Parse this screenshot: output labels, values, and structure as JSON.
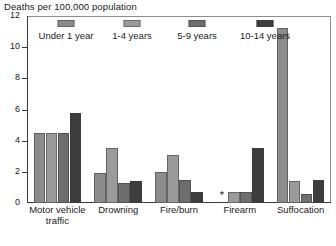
{
  "chart_data": {
    "type": "bar",
    "title": "Deaths per 100,000 population",
    "xlabel": "",
    "ylabel": "Deaths per 100,000 population",
    "ylim": [
      0,
      12
    ],
    "yticks": [
      0,
      2,
      4,
      6,
      8,
      10,
      12
    ],
    "grid": false,
    "legend_position": "top",
    "categories": [
      "Motor vehicle traffic",
      "Drowning",
      "Fire/burn",
      "Firearm",
      "Suffocation"
    ],
    "series": [
      {
        "name": "Under 1 year",
        "color": "#8c8c8c",
        "values": [
          4.5,
          1.9,
          2.0,
          null,
          11.2
        ],
        "value_labels": [
          "4.5",
          "1.9",
          "2.0",
          "*",
          "11.2"
        ]
      },
      {
        "name": "1-4 years",
        "color": "#9a9a9a",
        "values": [
          4.5,
          3.5,
          3.1,
          0.7,
          1.4
        ],
        "value_labels": [
          "4.5",
          "3.5",
          "3.1",
          "0.7",
          "1.4"
        ]
      },
      {
        "name": "5-9 years",
        "color": "#6e6e6e",
        "values": [
          4.5,
          1.3,
          1.5,
          0.7,
          0.6
        ],
        "value_labels": [
          "4.5",
          "1.3",
          "1.5",
          "0.7",
          "0.6"
        ]
      },
      {
        "name": "10-14 years",
        "color": "#3d3d3d",
        "values": [
          5.8,
          1.4,
          0.7,
          3.5,
          1.5
        ],
        "value_labels": [
          "5.8",
          "1.4",
          "0.7",
          "3.5",
          "1.5"
        ]
      }
    ],
    "annotations": [
      {
        "text": "*",
        "category": "Firearm",
        "series": "Under 1 year",
        "meaning": "suppressed-or-unstable-estimate"
      }
    ]
  },
  "legend": {
    "items": [
      {
        "label": "Under 1 year",
        "color": "#8c8c8c"
      },
      {
        "label": "1-4 years",
        "color": "#9a9a9a"
      },
      {
        "label": "5-9 years",
        "color": "#6e6e6e"
      },
      {
        "label": "10-14 years",
        "color": "#3d3d3d"
      }
    ]
  },
  "axis": {
    "y_tick_labels": [
      "0",
      "2",
      "4",
      "6",
      "8",
      "10",
      "12"
    ],
    "title": "Deaths per 100,000 population"
  },
  "category_labels": [
    {
      "line1": "Motor vehicle",
      "line2": "traffic"
    },
    {
      "line1": "Drowning",
      "line2": ""
    },
    {
      "line1": "Fire/burn",
      "line2": ""
    },
    {
      "line1": "Firearm",
      "line2": ""
    },
    {
      "line1": "Suffocation",
      "line2": ""
    }
  ]
}
